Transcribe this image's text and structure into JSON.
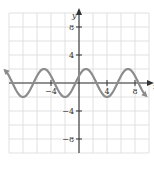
{
  "chart_data": {
    "type": "line",
    "title": "",
    "xlabel": "x",
    "ylabel": "y",
    "xlim": [
      -10,
      10
    ],
    "ylim": [
      -10,
      10
    ],
    "grid": true,
    "grid_step": 2,
    "x_ticks": [
      {
        "value": -4,
        "label": "−4"
      },
      {
        "value": 4,
        "label": "4"
      },
      {
        "value": 8,
        "label": "8"
      }
    ],
    "y_ticks": [
      {
        "value": 8,
        "label": "8"
      },
      {
        "value": 4,
        "label": "4"
      },
      {
        "value": -4,
        "label": "−4"
      },
      {
        "value": -8,
        "label": "−8"
      }
    ],
    "series": [
      {
        "name": "y = 2 sin(π(x + 0.5)/3)",
        "function": "2*sin(pi*(x+0.5)/3)",
        "amplitude": 2,
        "period": 6,
        "x_range": [
          -10.5,
          9.5
        ],
        "peaks_x": [
          -5,
          1,
          7
        ],
        "troughs_x": [
          -8,
          -2,
          4
        ],
        "arrows_both_ends": true,
        "color": "#8c8c8c"
      }
    ],
    "legend": null
  },
  "colors": {
    "grid": "#d9d9d9",
    "axis": "#333333",
    "curve": "#8c8c8c",
    "background": "#ffffff"
  }
}
